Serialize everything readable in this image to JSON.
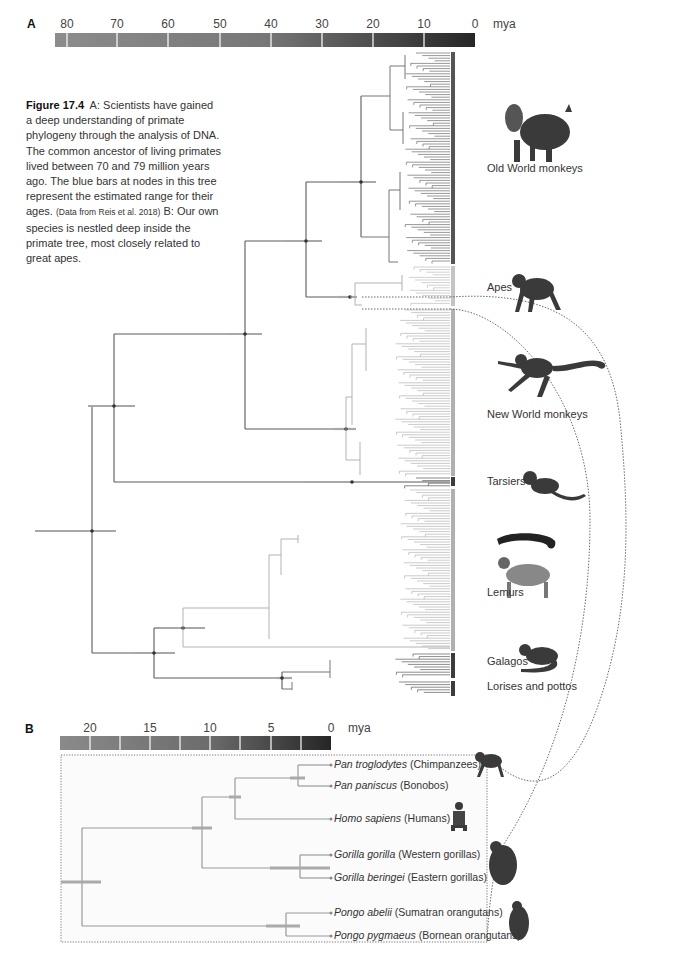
{
  "panel_a": {
    "letter": "A",
    "scale": {
      "ticks": [
        "80",
        "70",
        "60",
        "50",
        "40",
        "30",
        "20",
        "10",
        "0"
      ],
      "unit": "mya"
    },
    "caption": {
      "figure_label": "Figure 17.4",
      "text_a": "A: Scientists have gained a deep understanding of primate phylogeny through the analysis of DNA. The common ancestor of living primates lived between 70 and 79 million years ago. The blue bars at nodes in this tree represent the estimated range for their ages.",
      "citation": "(Data from Reis et al. 2018)",
      "text_b": "B: Our own species is nestled deep inside the primate tree, most closely related to great apes."
    },
    "clades": [
      {
        "label": "Old World monkeys",
        "icon": "mandrill-icon"
      },
      {
        "label": "Apes",
        "icon": "chimpanzee-icon"
      },
      {
        "label": "New World monkeys",
        "icon": "spider-monkey-icon"
      },
      {
        "label": "Tarsiers",
        "icon": "tarsier-icon"
      },
      {
        "label": "Lemurs",
        "icon": "ring-tailed-lemur-icon"
      },
      {
        "label": "Galagos",
        "icon": "galago-icon"
      },
      {
        "label": "Lorises and pottos",
        "icon": ""
      }
    ]
  },
  "panel_b": {
    "letter": "B",
    "scale": {
      "ticks": [
        "20",
        "15",
        "10",
        "5",
        "0"
      ],
      "unit": "mya"
    },
    "species": [
      {
        "scientific": "Pan troglodytes",
        "common": "(Chimpanzees)"
      },
      {
        "scientific": "Pan paniscus",
        "common": "(Bonobos)"
      },
      {
        "scientific": "Homo sapiens",
        "common": "(Humans)"
      },
      {
        "scientific": "Gorilla gorilla",
        "common": "(Western gorillas)"
      },
      {
        "scientific": "Gorilla beringei",
        "common": "(Eastern gorillas)"
      },
      {
        "scientific": "Pongo abelii",
        "common": "(Sumatran orangutans)"
      },
      {
        "scientific": "Pongo pygmaeus",
        "common": "(Bornean orangutans)"
      }
    ]
  },
  "colors": {
    "branch_dark": "#5a5a5a",
    "branch_light": "#b8b8b8",
    "node_bar": "#a8a8a8",
    "scale_dark": "#2a2a2a",
    "scale_light": "#8a8a8a"
  }
}
